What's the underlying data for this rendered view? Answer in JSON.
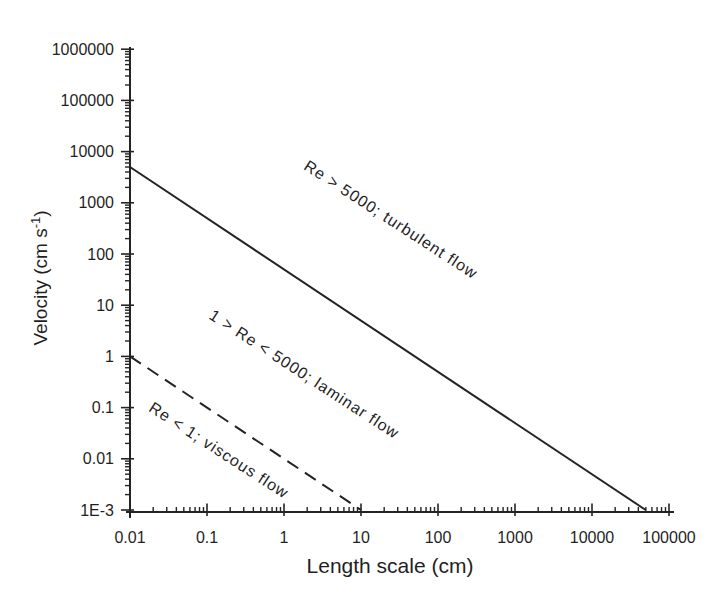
{
  "figure": {
    "background": "#ffffff",
    "ink_color": "#232323"
  },
  "chart_data": {
    "type": "line",
    "x_scale": "log",
    "y_scale": "log",
    "xlabel": "Length scale (cm)",
    "ylabel": {
      "pre": "Velocity (cm s",
      "sup": "-1",
      "post": ")"
    },
    "xlim": [
      0.01,
      100000
    ],
    "ylim": [
      0.001,
      1000000
    ],
    "grid": false,
    "legend": "none",
    "x_ticks": {
      "values": [
        0.01,
        0.1,
        1,
        10,
        100,
        1000,
        10000,
        100000
      ],
      "labels": [
        "0.01",
        "0.1",
        "1",
        "10",
        "100",
        "1000",
        "10000",
        "100000"
      ]
    },
    "y_ticks": {
      "values": [
        0.001,
        0.01,
        0.1,
        1,
        10,
        100,
        1000,
        10000,
        100000,
        1000000
      ],
      "labels": [
        "1E-3",
        "0.01",
        "0.1",
        "1",
        "10",
        "100",
        "1000",
        "10000",
        "100000",
        "1000000"
      ]
    },
    "series": [
      {
        "name": "Re = 5000 boundary",
        "style": "solid",
        "points": [
          [
            0.01,
            5000
          ],
          [
            50000,
            0.001
          ]
        ]
      },
      {
        "name": "Re = 1 boundary",
        "style": "dashed",
        "points": [
          [
            0.01,
            1
          ],
          [
            10,
            0.001
          ]
        ]
      }
    ],
    "annotations": [
      {
        "text": "Re > 5000; turbulent flow",
        "x": 24,
        "y": 450,
        "rotation_deg": 33
      },
      {
        "text": "1 > Re < 5000; laminar flow",
        "x": 1.8,
        "y": 0.43,
        "rotation_deg": 33
      },
      {
        "text": "Re < 1; viscous flow",
        "x": 0.14,
        "y": 0.014,
        "rotation_deg": 33
      }
    ]
  }
}
